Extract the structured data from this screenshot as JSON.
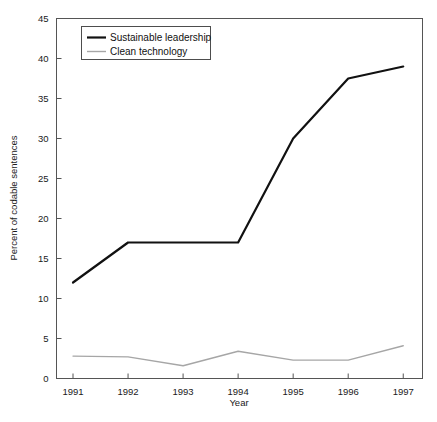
{
  "chart_data": {
    "type": "line",
    "title": "",
    "xlabel": "Year",
    "ylabel": "Percent of codable sentences",
    "categories": [
      "1991",
      "1992",
      "1993",
      "1994",
      "1995",
      "1996",
      "1997"
    ],
    "x": [
      1991,
      1992,
      1993,
      1994,
      1995,
      1996,
      1997
    ],
    "xlim": [
      1990.7,
      1997.35
    ],
    "ylim": [
      0,
      45
    ],
    "yticks": [
      0,
      5,
      10,
      15,
      20,
      25,
      30,
      35,
      40,
      45
    ],
    "ytick_labels": [
      "0",
      "5",
      "10",
      "15",
      "20",
      "25",
      "30",
      "35",
      "40",
      "45"
    ],
    "xticks": [
      1991,
      1992,
      1993,
      1994,
      1995,
      1996,
      1997
    ],
    "xtick_labels": [
      "1991",
      "1992",
      "1993",
      "1994",
      "1995",
      "1996",
      "1997"
    ],
    "grid": false,
    "legend_position": "top-left-inside",
    "series": [
      {
        "name": "Sustainable leadership",
        "color": "#111111",
        "line_width": 2.2,
        "values": [
          12,
          17,
          17,
          17,
          30,
          37.5,
          39
        ]
      },
      {
        "name": "Clean technology",
        "color": "#a6a6a6",
        "line_width": 1.4,
        "values": [
          2.8,
          2.7,
          1.6,
          3.4,
          2.3,
          2.3,
          4.1
        ]
      }
    ]
  },
  "legend": {
    "entries": [
      {
        "label": "Sustainable leadership"
      },
      {
        "label": "Clean technology"
      }
    ]
  },
  "axes": {
    "x_title": "Year",
    "y_title": "Percent of codable sentences"
  }
}
